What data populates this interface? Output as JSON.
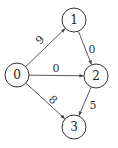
{
  "graph": {
    "directed": true,
    "nodes": [
      {
        "id": "0",
        "label": "0",
        "x": 17,
        "y": 75
      },
      {
        "id": "1",
        "label": "1",
        "x": 74,
        "y": 20
      },
      {
        "id": "2",
        "label": "2",
        "x": 96,
        "y": 76
      },
      {
        "id": "3",
        "label": "3",
        "x": 74,
        "y": 127
      }
    ],
    "edges": [
      {
        "from": "0",
        "to": "1",
        "weight": "9",
        "lx": 40,
        "ly": 40,
        "rot": -44
      },
      {
        "from": "0",
        "to": "2",
        "weight": "0",
        "lx": 56,
        "ly": 68,
        "rot": 0
      },
      {
        "from": "0",
        "to": "3",
        "weight": "8",
        "lx": 53,
        "ly": 100,
        "rot": 42
      },
      {
        "from": "1",
        "to": "2",
        "weight": "0",
        "lx": 92,
        "ly": 49,
        "rot": 0
      },
      {
        "from": "2",
        "to": "3",
        "weight": "5",
        "lx": 93,
        "ly": 105,
        "rot": 0
      }
    ]
  }
}
